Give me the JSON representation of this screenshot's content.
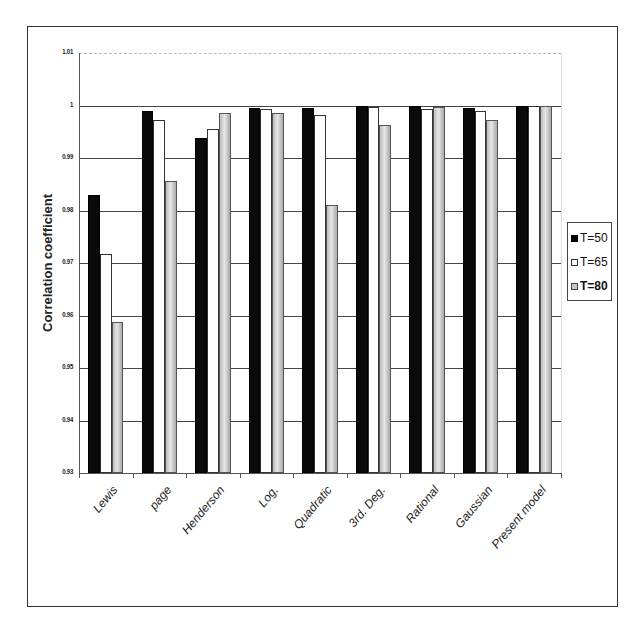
{
  "chart_data": {
    "type": "bar",
    "title": "",
    "xlabel": "",
    "ylabel": "Correlation coefficient",
    "ylim": [
      0.93,
      1.01
    ],
    "yticks": [
      "0.93",
      "0.94",
      "0.95",
      "0.96",
      "0.97",
      "0.98",
      "0.99",
      "1",
      "1.01"
    ],
    "grid": true,
    "legend_position": "right",
    "categories": [
      "Lewis",
      "page",
      "Henderson",
      "Log.",
      "Quadratic",
      "3rd. Deg.",
      "Rational",
      "Gaussian",
      "Present model"
    ],
    "series": [
      {
        "name": "T=50",
        "color": "#000000",
        "values": [
          0.983,
          0.999,
          0.9938,
          0.9996,
          0.9996,
          1.0,
          0.9999,
          0.9995,
          1.0
        ]
      },
      {
        "name": "T=65",
        "color": "#ffffff",
        "values": [
          0.9717,
          0.9973,
          0.9955,
          0.9993,
          0.9982,
          0.9997,
          0.9993,
          0.999,
          1.0
        ]
      },
      {
        "name": "T=80",
        "color": "#c0c0c0",
        "values": [
          0.9587,
          0.9856,
          0.9985,
          0.9986,
          0.981,
          0.9962,
          0.9998,
          0.9973,
          0.9999
        ]
      }
    ]
  },
  "legend": {
    "items": [
      {
        "label": "T=50",
        "swatch": "s0",
        "bold": false
      },
      {
        "label": "T=65",
        "swatch": "s1",
        "bold": false
      },
      {
        "label": "T=80",
        "swatch": "s2",
        "bold": true
      }
    ]
  }
}
